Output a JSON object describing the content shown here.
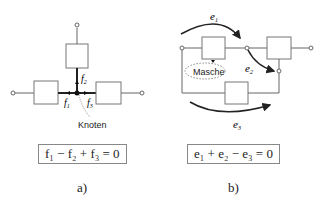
{
  "panel_a": {
    "caption": "a)",
    "node_label": "Knoten",
    "flow_labels": [
      "f1",
      "f2",
      "f3"
    ],
    "equation": "f₁ − f₂ + f₃ = 0"
  },
  "panel_b": {
    "caption": "b)",
    "mesh_label": "Masche",
    "effort_labels": [
      "e1",
      "e2",
      "e3"
    ],
    "equation": "e₁ + e₂ − e₃ = 0"
  },
  "colors": {
    "line": "#333333",
    "box": "#666666"
  }
}
